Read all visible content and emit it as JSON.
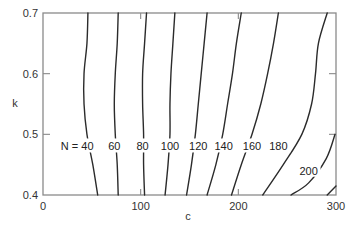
{
  "chart_data": {
    "type": "contour",
    "title": "",
    "xlabel": "c",
    "ylabel": "k",
    "xlim": [
      0,
      300
    ],
    "ylim": [
      0.4,
      0.7
    ],
    "grid": false,
    "legend": null,
    "x_ticks": [
      0,
      100,
      200,
      300
    ],
    "x_tick_labels": [
      "0",
      "100",
      "200",
      "300"
    ],
    "y_ticks": [
      0.4,
      0.5,
      0.6,
      0.7
    ],
    "y_tick_labels": [
      "0.4",
      "0.5",
      "0.6",
      "0.7"
    ],
    "contour_variable": "N",
    "series": [
      {
        "name": "N = 40",
        "level": 40,
        "label": "N = 40",
        "points": [
          [
            46,
            0.7
          ],
          [
            45,
            0.65
          ],
          [
            42,
            0.6
          ],
          [
            42,
            0.55
          ],
          [
            45,
            0.5
          ],
          [
            51,
            0.45
          ],
          [
            56,
            0.4
          ]
        ]
      },
      {
        "name": "60",
        "level": 60,
        "label": "60",
        "points": [
          [
            77,
            0.7
          ],
          [
            76,
            0.65
          ],
          [
            74,
            0.6
          ],
          [
            73,
            0.55
          ],
          [
            74,
            0.5
          ],
          [
            76,
            0.45
          ],
          [
            77,
            0.4
          ]
        ]
      },
      {
        "name": "80",
        "level": 80,
        "label": "80",
        "points": [
          [
            106,
            0.7
          ],
          [
            104,
            0.65
          ],
          [
            102,
            0.6
          ],
          [
            102,
            0.55
          ],
          [
            103,
            0.5
          ],
          [
            103,
            0.45
          ],
          [
            104,
            0.4
          ]
        ]
      },
      {
        "name": "100",
        "level": 100,
        "label": "100",
        "points": [
          [
            135,
            0.7
          ],
          [
            133,
            0.65
          ],
          [
            131,
            0.6
          ],
          [
            130,
            0.55
          ],
          [
            130,
            0.5
          ],
          [
            128,
            0.45
          ],
          [
            125,
            0.4
          ]
        ]
      },
      {
        "name": "120",
        "level": 120,
        "label": "120",
        "points": [
          [
            168,
            0.7
          ],
          [
            165,
            0.65
          ],
          [
            162,
            0.6
          ],
          [
            159,
            0.55
          ],
          [
            156,
            0.5
          ],
          [
            152,
            0.45
          ],
          [
            147,
            0.4
          ]
        ]
      },
      {
        "name": "140",
        "level": 140,
        "label": "140",
        "points": [
          [
            203,
            0.7
          ],
          [
            198,
            0.65
          ],
          [
            194,
            0.6
          ],
          [
            189,
            0.55
          ],
          [
            184,
            0.5
          ],
          [
            177,
            0.45
          ],
          [
            168,
            0.4
          ]
        ]
      },
      {
        "name": "160",
        "level": 160,
        "label": "160",
        "points": [
          [
            241,
            0.7
          ],
          [
            236,
            0.65
          ],
          [
            230,
            0.6
          ],
          [
            223,
            0.55
          ],
          [
            214,
            0.5
          ],
          [
            203,
            0.45
          ],
          [
            193,
            0.4
          ]
        ]
      },
      {
        "name": "180",
        "level": 180,
        "label": "180",
        "points": [
          [
            291,
            0.7
          ],
          [
            282,
            0.65
          ],
          [
            279,
            0.6
          ],
          [
            275,
            0.55
          ],
          [
            265,
            0.5
          ],
          [
            246,
            0.45
          ],
          [
            225,
            0.4
          ]
        ]
      },
      {
        "name": "200",
        "level": 200,
        "label": "200",
        "points": [
          [
            299,
            0.5
          ],
          [
            290,
            0.46
          ],
          [
            272,
            0.42
          ],
          [
            254,
            0.4
          ]
        ]
      },
      {
        "name": "220",
        "level": 220,
        "label": "",
        "points": [
          [
            300,
            0.415
          ],
          [
            291,
            0.4
          ]
        ]
      }
    ],
    "annotations": [
      {
        "text": "N = 40",
        "x": 35,
        "y": 0.48
      },
      {
        "text": "60",
        "x": 73,
        "y": 0.48
      },
      {
        "text": "80",
        "x": 102,
        "y": 0.48
      },
      {
        "text": "100",
        "x": 130,
        "y": 0.48
      },
      {
        "text": "120",
        "x": 159,
        "y": 0.48
      },
      {
        "text": "140",
        "x": 185,
        "y": 0.48
      },
      {
        "text": "160",
        "x": 214,
        "y": 0.48
      },
      {
        "text": "180",
        "x": 241,
        "y": 0.48
      },
      {
        "text": "200",
        "x": 272,
        "y": 0.44
      }
    ]
  }
}
